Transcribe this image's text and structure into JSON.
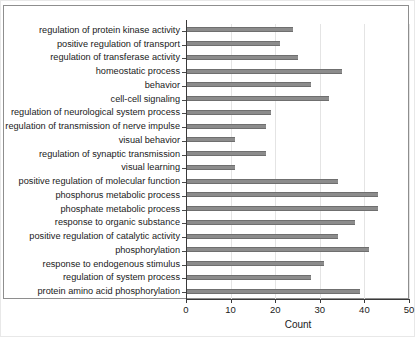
{
  "chart_data": {
    "type": "bar",
    "orientation": "horizontal",
    "title": "",
    "xlabel": "Count",
    "ylabel": "",
    "xlim": [
      0,
      50
    ],
    "xticks": [
      0,
      10,
      20,
      30,
      40,
      50
    ],
    "grid": "vertical",
    "legend": null,
    "bar_color": "#8c8c8c",
    "categories": [
      "regulation of protein kinase activity",
      "positive regulation of transport",
      "regulation of transferase activity",
      "homeostatic process",
      "behavior",
      "cell-cell signaling",
      "regulation of neurological system process",
      "regulation of transmission of nerve impulse",
      "visual behavior",
      "regulation of synaptic transmission",
      "visual learning",
      "positive regulation of molecular function",
      "phosphorus metabolic process",
      "phosphate metabolic process",
      "response to organic substance",
      "positive regulation of catalytic activity",
      "phosphorylation",
      "response to endogenous stimulus",
      "regulation of system process",
      "protein amino acid phosphorylation"
    ],
    "values": [
      24,
      21,
      25,
      35,
      28,
      32,
      19,
      18,
      11,
      18,
      11,
      34,
      43,
      43,
      38,
      34,
      41,
      31,
      28,
      39
    ]
  }
}
